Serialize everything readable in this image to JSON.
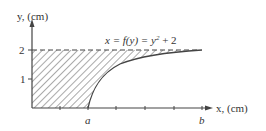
{
  "figure": {
    "y_axis_label": "y, (cm)",
    "x_axis_label": "x, (cm)",
    "equation": {
      "lhs": "x = f(y) = y",
      "exp": "2",
      "rhs": " + 2"
    },
    "y_ticks": [
      "1",
      "2"
    ],
    "x_markers": [
      "a",
      "b"
    ],
    "curve": "x = y^2 + 2",
    "region": "hatched area bounded by y-axis, x-axis, y = 2 and the curve"
  }
}
